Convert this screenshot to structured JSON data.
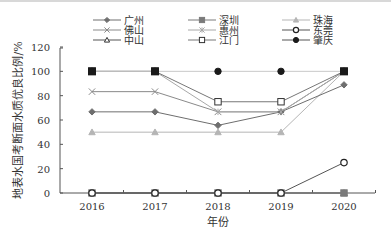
{
  "chart_data": {
    "type": "line",
    "title": "",
    "xlabel": "年份",
    "ylabel": "地表水国考断面水质优良比例/%",
    "x": [
      "2016",
      "2017",
      "2018",
      "2019",
      "2020"
    ],
    "ylim": [
      0,
      120
    ],
    "yticks": [
      0,
      20,
      40,
      60,
      80,
      100,
      120
    ],
    "grid": false,
    "legend_position": "top",
    "series": [
      {
        "name": "广州",
        "marker": "diamond",
        "color": "#6e6e6e",
        "fill": "#6e6e6e",
        "values": [
          66.7,
          66.7,
          55.6,
          66.7,
          88.9
        ]
      },
      {
        "name": "深圳",
        "marker": "square",
        "color": "#7a7a7a",
        "fill": "#7a7a7a",
        "values": [
          0,
          0,
          0,
          0,
          0
        ]
      },
      {
        "name": "珠海",
        "marker": "triangle",
        "color": "#b5b5b5",
        "fill": "#b5b5b5",
        "values": [
          50,
          50,
          50,
          50,
          100
        ]
      },
      {
        "name": "佛山",
        "marker": "x",
        "color": "#8a8a8a",
        "fill": "none",
        "values": [
          83.3,
          83.3,
          66.7,
          66.7,
          100
        ]
      },
      {
        "name": "惠州",
        "marker": "star",
        "color": "#a8a8a8",
        "fill": "none",
        "values": [
          100,
          100,
          66.7,
          66.7,
          100
        ]
      },
      {
        "name": "东莞",
        "marker": "circle-open",
        "color": "#555555",
        "fill": "#ffffff",
        "values": [
          0,
          0,
          0,
          0,
          25
        ]
      },
      {
        "name": "中山",
        "marker": "triangle-open",
        "color": "#555555",
        "fill": "#ffffff",
        "values": [
          0,
          0,
          0,
          0,
          0
        ]
      },
      {
        "name": "江门",
        "marker": "square-open",
        "color": "#777777",
        "fill": "#ffffff",
        "values": [
          100,
          100,
          75,
          75,
          100
        ]
      },
      {
        "name": "肇庆",
        "marker": "circle",
        "color": "#c8c8c8",
        "fill": "#1a1a1a",
        "values": [
          100,
          100,
          100,
          100,
          100
        ]
      }
    ]
  },
  "legend": [
    {
      "label": "广州"
    },
    {
      "label": "深圳"
    },
    {
      "label": "珠海"
    },
    {
      "label": "佛山"
    },
    {
      "label": "惠州"
    },
    {
      "label": "东莞"
    },
    {
      "label": "中山"
    },
    {
      "label": "江门"
    },
    {
      "label": "肇庆"
    }
  ]
}
